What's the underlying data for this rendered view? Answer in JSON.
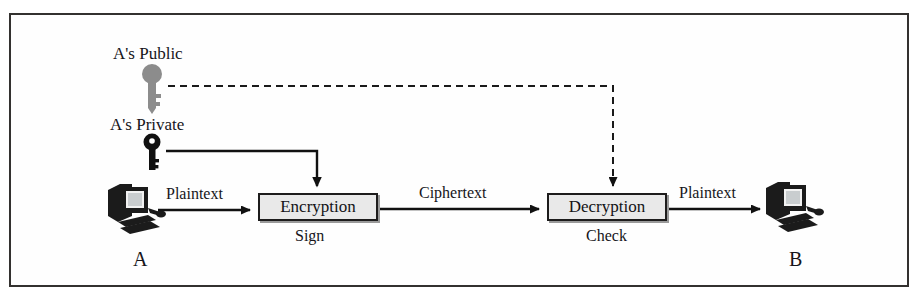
{
  "diagram": {
    "frame_border_color": "#33312f",
    "background_color": "#ffffff"
  },
  "keys": [
    {
      "id": "public-key",
      "label": "A's Public",
      "color": "#8c8c8c",
      "type": "public"
    },
    {
      "id": "private-key",
      "label": "A's Private",
      "color": "#101010",
      "type": "private"
    }
  ],
  "nodes": [
    {
      "id": "sender",
      "label": "A",
      "icon": "computer-icon"
    },
    {
      "id": "receiver",
      "label": "B",
      "icon": "computer-icon"
    }
  ],
  "processes": [
    {
      "id": "encryption",
      "label": "Encryption",
      "sublabel": "Sign",
      "fill": "#e9e9e9",
      "border": "#1d1c1c"
    },
    {
      "id": "decryption",
      "label": "Decryption",
      "sublabel": "Check",
      "fill": "#e9e9e9",
      "border": "#1d1c1c"
    }
  ],
  "flows": [
    {
      "id": "flow-plaintext-in",
      "label": "Plaintext",
      "style": "solid"
    },
    {
      "id": "flow-ciphertext",
      "label": "Ciphertext",
      "style": "solid"
    },
    {
      "id": "flow-plaintext-out",
      "label": "Plaintext",
      "style": "solid"
    },
    {
      "id": "flow-private-key",
      "label": "",
      "style": "solid"
    },
    {
      "id": "flow-public-key",
      "label": "",
      "style": "dashed"
    }
  ]
}
